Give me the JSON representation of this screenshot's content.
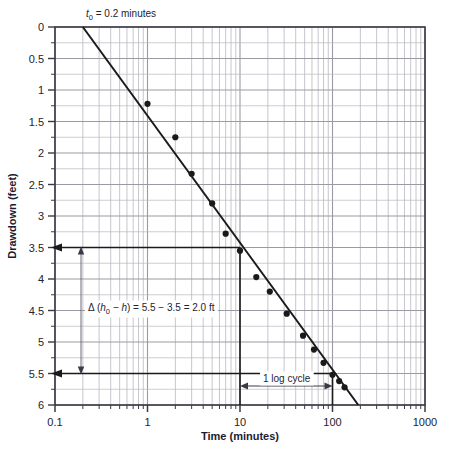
{
  "chart_data": {
    "type": "scatter",
    "title": "",
    "xlabel": "Time (minutes)",
    "ylabel": "Drawdown (feet)",
    "xscale": "log",
    "yscale": "linear",
    "xlim": [
      0.1,
      1000
    ],
    "ylim": [
      0,
      6
    ],
    "y_inverted": true,
    "grid": true,
    "legend": null,
    "x_ticks": [
      "0.1",
      "1",
      "10",
      "100",
      "1000"
    ],
    "y_ticks": [
      "0",
      "0.5",
      "1",
      "1.5",
      "2",
      "2.5",
      "3",
      "3.5",
      "4",
      "4.5",
      "5",
      "5.5",
      "6"
    ],
    "series": [
      {
        "name": "observed drawdown",
        "marker": "filled-circle",
        "color": "#1a1a1a",
        "points": [
          {
            "x": 1.0,
            "y": 1.22
          },
          {
            "x": 2.0,
            "y": 1.75
          },
          {
            "x": 3.0,
            "y": 2.33
          },
          {
            "x": 5.0,
            "y": 2.8
          },
          {
            "x": 7.0,
            "y": 3.28
          },
          {
            "x": 10.0,
            "y": 3.55
          },
          {
            "x": 15.0,
            "y": 3.97
          },
          {
            "x": 21.0,
            "y": 4.2
          },
          {
            "x": 32.0,
            "y": 4.55
          },
          {
            "x": 48.0,
            "y": 4.9
          },
          {
            "x": 63.0,
            "y": 5.12
          },
          {
            "x": 80.0,
            "y": 5.33
          },
          {
            "x": 100.0,
            "y": 5.52
          },
          {
            "x": 118.0,
            "y": 5.62
          },
          {
            "x": 135.0,
            "y": 5.72
          }
        ]
      }
    ],
    "fit_line": {
      "name": "straight-line fit",
      "color": "#1a1a1a",
      "x0": 0.2,
      "y0": 0.0,
      "x1": 190.0,
      "y1": 6.0
    },
    "annotations": {
      "t0_label": "t0 = 0.2 minutes",
      "t0_symbol": "t",
      "t0_subscript": "0",
      "t0_rest": " = 0.2 minutes",
      "t0_value": 0.2,
      "delta_label": "Δ (h0 − h) = 5.5 − 3.5 = 2.0 ft",
      "delta_parts": {
        "delta": "Δ (",
        "h_italic": "h",
        "h_sub": "0",
        "minus_h": " − h",
        "close": ") = 5.5 − 3.5 = 2.0 ft"
      },
      "delta_value": 2.0,
      "delta_upper": 3.5,
      "delta_lower": 5.5,
      "log_cycle_label": "1 log cycle",
      "log_cycle_from": 10,
      "log_cycle_to": 100,
      "guide_y_upper": 3.5,
      "guide_y_lower": 5.5
    },
    "colors": {
      "grid": "#9a9aa3",
      "grid_minor": "#b8b8c0",
      "axis": "#3a3a46",
      "data": "#1a1a1a",
      "text": "#23232f",
      "axis_title": "#1b1b33",
      "background": "#ffffff"
    }
  }
}
